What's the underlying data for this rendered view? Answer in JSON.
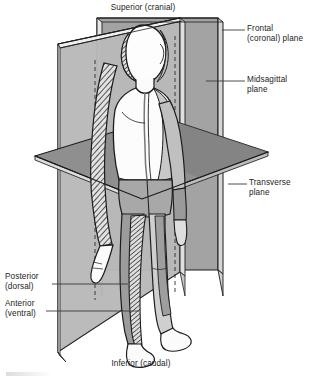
{
  "labels": {
    "superior": "Superior (cranial)",
    "inferior": "Inferior (caudal)",
    "frontal_line1": "Frontal",
    "frontal_line2": "(coronal) plane",
    "midsagittal_line1": "Midsagittal",
    "midsagittal_line2": "plane",
    "transverse_line1": "Transverse",
    "transverse_line2": "plane",
    "posterior_line1": "Posterior",
    "posterior_line2": "(dorsal)",
    "anterior_line1": "Anterior",
    "anterior_line2": "(ventral)"
  },
  "planes": [
    {
      "name": "frontal-coronal-plane",
      "label": "Frontal (coronal) plane",
      "orientation": "vertical, divides body into anterior and posterior",
      "fill": "#9d9d9d"
    },
    {
      "name": "midsagittal-plane",
      "label": "Midsagittal plane",
      "orientation": "vertical, divides body into left and right halves",
      "fill": "#b4b4b4"
    },
    {
      "name": "transverse-plane",
      "label": "Transverse plane",
      "orientation": "horizontal, divides body into superior and inferior",
      "fill": "#8a8a8a"
    }
  ],
  "directions": [
    {
      "name": "superior",
      "label": "Superior (cranial)",
      "position": "top"
    },
    {
      "name": "inferior",
      "label": "Inferior (caudal)",
      "position": "bottom"
    },
    {
      "name": "posterior",
      "label": "Posterior (dorsal)",
      "position": "left-lower"
    },
    {
      "name": "anterior",
      "label": "Anterior (ventral)",
      "position": "left-lower"
    }
  ],
  "colors": {
    "line": "#1c1c1c",
    "leader": "#4a4a4a",
    "plane_light": "#c2c2c2",
    "plane_mid": "#a8a8a8",
    "plane_dark": "#8a8a8a",
    "plane_darkest": "#6f6f6f",
    "body_light": "#fdfdfd",
    "body_shade": "#c9c9c9",
    "body_shade_dark": "#a9a9a9",
    "background": "#ffffff"
  }
}
